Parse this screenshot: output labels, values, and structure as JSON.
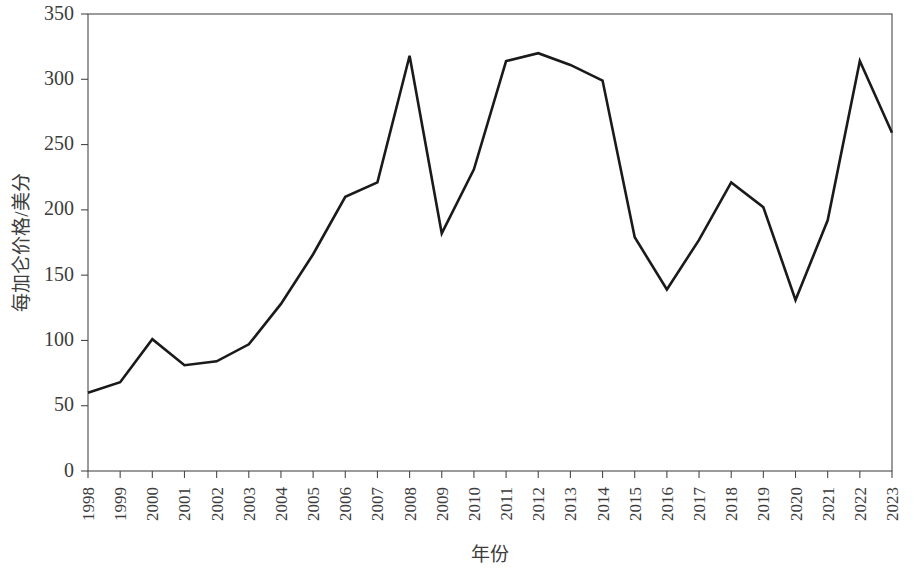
{
  "chart_data": {
    "type": "line",
    "title": "",
    "xlabel": "年份",
    "ylabel": "每加仑价格/美分",
    "xlim": [
      1998,
      2023
    ],
    "ylim": [
      0,
      350
    ],
    "ytick_values": [
      0,
      50,
      100,
      150,
      200,
      250,
      300,
      350
    ],
    "ytick_labels": [
      "0",
      "50",
      "100",
      "150",
      "200",
      "250",
      "300",
      "350"
    ],
    "grid": false,
    "legend": "none",
    "line_color": "#1a1a1a",
    "axis_color": "#4a4a4a",
    "categories": [
      "1998",
      "1999",
      "2000",
      "2001",
      "2002",
      "2003",
      "2004",
      "2005",
      "2006",
      "2007",
      "2008",
      "2009",
      "2010",
      "2011",
      "2012",
      "2013",
      "2014",
      "2015",
      "2016",
      "2017",
      "2018",
      "2019",
      "2020",
      "2021",
      "2022",
      "2023"
    ],
    "values": [
      60,
      68,
      101,
      81,
      84,
      97,
      128,
      166,
      210,
      221,
      318,
      182,
      231,
      314,
      320,
      311,
      299,
      179,
      139,
      177,
      221,
      202,
      131,
      192,
      314,
      259
    ],
    "series": [
      {
        "name": "每加仑价格/美分",
        "values": [
          60,
          68,
          101,
          81,
          84,
          97,
          128,
          166,
          210,
          221,
          318,
          182,
          231,
          314,
          320,
          311,
          299,
          179,
          139,
          177,
          221,
          202,
          131,
          192,
          314,
          259
        ]
      }
    ]
  }
}
